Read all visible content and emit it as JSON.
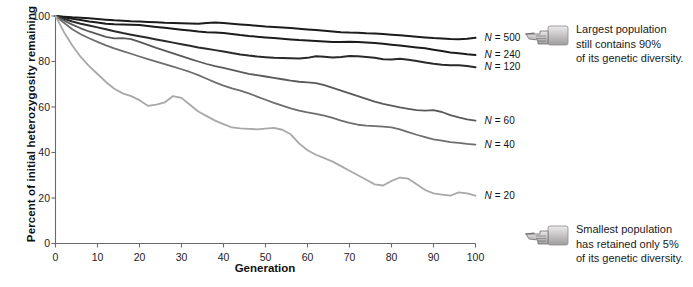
{
  "chart_data": {
    "type": "line",
    "title": "",
    "xlabel": "Generation",
    "ylabel": "Percent of initial heterozygosity remaining",
    "xlim": [
      0,
      100
    ],
    "ylim": [
      0,
      100
    ],
    "xticks": [
      0,
      10,
      20,
      30,
      40,
      50,
      60,
      70,
      80,
      90,
      100
    ],
    "yticks": [
      0,
      20,
      40,
      60,
      80,
      100
    ],
    "grid": false,
    "legend_position": "right-inline-end-labels",
    "x": [
      0,
      2,
      4,
      6,
      8,
      10,
      12,
      14,
      16,
      18,
      20,
      22,
      24,
      26,
      28,
      30,
      32,
      34,
      36,
      38,
      40,
      42,
      44,
      46,
      48,
      50,
      52,
      54,
      56,
      58,
      60,
      62,
      64,
      66,
      68,
      70,
      72,
      74,
      76,
      78,
      80,
      82,
      84,
      86,
      88,
      90,
      92,
      94,
      96,
      98,
      100
    ],
    "series": [
      {
        "name": "N = 500",
        "label": "N = 500",
        "color": "#1c1c1c",
        "width": 2.0,
        "values": [
          100,
          99.7,
          99.4,
          99.2,
          99.0,
          98.7,
          98.4,
          98.1,
          97.9,
          97.7,
          97.6,
          97.4,
          97.2,
          97.0,
          96.9,
          96.8,
          96.7,
          96.6,
          96.9,
          97.1,
          96.9,
          96.6,
          96.3,
          96.0,
          95.7,
          95.4,
          95.2,
          95.0,
          94.7,
          94.4,
          94.1,
          93.8,
          93.5,
          93.2,
          92.9,
          92.7,
          92.6,
          92.4,
          92.3,
          92.1,
          91.8,
          91.5,
          91.2,
          90.9,
          90.6,
          90.3,
          90.1,
          89.9,
          89.8,
          90.0,
          90.4
        ]
      },
      {
        "name": "N = 240",
        "label": "N = 240",
        "color": "#1c1c1c",
        "width": 2.0,
        "values": [
          100,
          99.4,
          98.8,
          98.2,
          97.6,
          97.1,
          96.6,
          96.4,
          96.3,
          96.2,
          96.0,
          95.6,
          95.2,
          94.8,
          94.4,
          94.0,
          93.6,
          93.2,
          92.9,
          92.7,
          92.5,
          92.1,
          91.6,
          91.2,
          90.9,
          90.6,
          90.3,
          90.0,
          89.7,
          89.4,
          89.2,
          89.0,
          88.8,
          88.6,
          88.6,
          88.7,
          88.6,
          88.4,
          88.1,
          87.8,
          87.4,
          87.0,
          86.6,
          86.2,
          85.8,
          85.2,
          84.6,
          84.0,
          83.6,
          83.2,
          82.9
        ]
      },
      {
        "name": "N = 120",
        "label": "N = 120",
        "color": "#2a2a2a",
        "width": 2.0,
        "values": [
          100,
          98.8,
          97.6,
          96.6,
          95.8,
          95.0,
          94.2,
          93.3,
          92.5,
          91.8,
          91.1,
          90.4,
          89.7,
          89.0,
          88.3,
          87.6,
          86.9,
          86.2,
          85.6,
          85.0,
          84.4,
          83.7,
          83.1,
          82.6,
          82.2,
          81.9,
          81.6,
          81.5,
          81.4,
          81.3,
          81.6,
          82.3,
          82.1,
          81.8,
          82.0,
          82.4,
          82.3,
          82.0,
          81.6,
          81.0,
          80.9,
          81.2,
          80.8,
          80.2,
          79.6,
          79.0,
          78.6,
          78.4,
          78.3,
          78.0,
          77.5
        ]
      },
      {
        "name": "N = 60",
        "label": "N = 60",
        "color": "#5a5a5a",
        "width": 1.8,
        "values": [
          100,
          98.0,
          96.2,
          94.6,
          93.2,
          92.0,
          90.8,
          90.2,
          90.3,
          89.8,
          88.6,
          87.3,
          86.0,
          84.8,
          83.6,
          82.4,
          81.2,
          80.0,
          78.9,
          78.0,
          77.2,
          76.3,
          75.4,
          74.6,
          74.0,
          73.4,
          72.8,
          72.2,
          71.6,
          71.1,
          70.8,
          70.5,
          69.6,
          68.4,
          67.2,
          66.0,
          64.8,
          63.6,
          62.4,
          61.4,
          60.6,
          59.8,
          59.2,
          58.6,
          58.4,
          58.6,
          57.8,
          56.4,
          55.4,
          54.6,
          54.0
        ]
      },
      {
        "name": "N = 40",
        "label": "N = 40",
        "color": "#6e6e6e",
        "width": 1.8,
        "values": [
          100,
          97.0,
          94.2,
          92.0,
          90.2,
          88.6,
          87.1,
          85.8,
          84.6,
          83.4,
          82.2,
          81.0,
          79.9,
          78.8,
          77.7,
          76.6,
          75.4,
          74.0,
          72.4,
          70.8,
          69.4,
          68.2,
          67.2,
          66.0,
          64.6,
          63.2,
          61.8,
          60.6,
          59.4,
          58.4,
          57.6,
          57.0,
          56.2,
          55.2,
          54.0,
          53.0,
          52.2,
          51.8,
          51.6,
          51.4,
          51.0,
          50.2,
          49.0,
          47.8,
          46.8,
          45.8,
          45.2,
          44.6,
          44.2,
          43.8,
          43.5
        ]
      },
      {
        "name": "N = 20",
        "label": "N = 20",
        "color": "#a8a8a8",
        "width": 1.8,
        "values": [
          100,
          93.0,
          87.0,
          82.0,
          78.0,
          74.5,
          71.0,
          68.0,
          66.0,
          64.8,
          63.0,
          60.5,
          61.0,
          62.0,
          64.8,
          64.0,
          61.0,
          58.0,
          56.0,
          54.0,
          52.5,
          51.0,
          50.6,
          50.4,
          50.2,
          50.5,
          50.8,
          50.0,
          48.0,
          44.0,
          41.0,
          39.0,
          37.5,
          36.0,
          34.0,
          32.0,
          30.0,
          28.0,
          26.0,
          25.5,
          27.5,
          29.0,
          28.5,
          26.0,
          23.5,
          22.0,
          21.5,
          21.0,
          22.5,
          22.0,
          21.0
        ]
      }
    ],
    "annotations": [
      {
        "id": "largest-population",
        "icon": "pointing-hand-icon",
        "text": "Largest population\nstill contains 90%\nof its genetic diversity."
      },
      {
        "id": "smallest-population",
        "icon": "pointing-hand-icon",
        "text": "Smallest population\nhas retained only 5%\nof its genetic diversity."
      }
    ],
    "colors": {
      "axis": "#6a6a6a",
      "text": "#1a1a1a",
      "background": "#ffffff"
    }
  }
}
